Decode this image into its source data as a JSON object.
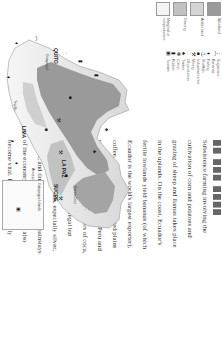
{
  "legend": {
    "land_use": [
      {
        "label": "Woodland",
        "color": "#9a9a9a"
      },
      {
        "label": "Arable land",
        "color": "#d4d4d4"
      },
      {
        "label": "Grazing",
        "color": "#c2c2c2"
      },
      {
        "label": "Marginal or nonproductive",
        "color": "#f4f4f4"
      }
    ],
    "symbols": [
      {
        "icon": "sugarcane-icon",
        "glyph": "↕",
        "label": "Sugarcane"
      },
      {
        "icon": "bananas-icon",
        "glyph": "⌒",
        "label": "Bananas"
      },
      {
        "icon": "fishing-icon",
        "glyph": "♦",
        "label": "Fishing"
      },
      {
        "icon": "shellfish-icon",
        "glyph": "⚓",
        "label": "Shellfish"
      },
      {
        "icon": "industrial-center-icon",
        "glyph": "■",
        "label": "Industrial center"
      },
      {
        "icon": "mining-icon",
        "glyph": "⚒",
        "label": "Mining"
      },
      {
        "icon": "oil-production-icon",
        "glyph": "⎕",
        "label": "Oil production"
      },
      {
        "icon": "timber-icon",
        "glyph": "♣",
        "label": "Timber"
      },
      {
        "icon": "cotton-icon",
        "glyph": "❁",
        "label": "Cotton"
      },
      {
        "icon": "rubber-icon",
        "glyph": "▮",
        "label": "Rubber"
      },
      {
        "icon": "tourism-icon",
        "glyph": "▣",
        "label": "Tourism"
      }
    ]
  },
  "text": {
    "lines": [
      "Subsistence farming involving the",
      "cultivation of corn and potatoes and",
      "grazing of sheep and llamas takes place",
      "in the uplands. On the coast, Ecuador's",
      "fertile lowlands yield bananas (of which",
      "Ecuador is the world's largest exporter),",
      "coffee, and sugar. Peru's irrigated plains",
      "produce sugar, cotton, and rice. Peru and",
      "Bolivia are the leading producers of coca,",
      "the source of cocaine, an illegal but",
      "profitable crop. Metals, especially silver,",
      "copper, and tin, have long been mainstays",
      "of the economy; oil and gas have also",
      "become vital. Industries are mainly",
      "resource-based and include smelting, oil",
      "refining, food processing, and textiles."
    ]
  },
  "map": {
    "cities": [
      {
        "name": "QUITO",
        "kind": "capital"
      },
      {
        "name": "LIMA",
        "kind": "capital"
      },
      {
        "name": "LA PAZ",
        "kind": "capital"
      },
      {
        "name": "SUCRE",
        "kind": "capital"
      },
      {
        "name": "Guayaquil",
        "kind": "town"
      },
      {
        "name": "Trujillo",
        "kind": "town"
      },
      {
        "name": "Arequipa",
        "kind": "town"
      },
      {
        "name": "Santa Cruz",
        "kind": "town"
      }
    ],
    "inset_label": "Galapagos Islands"
  }
}
